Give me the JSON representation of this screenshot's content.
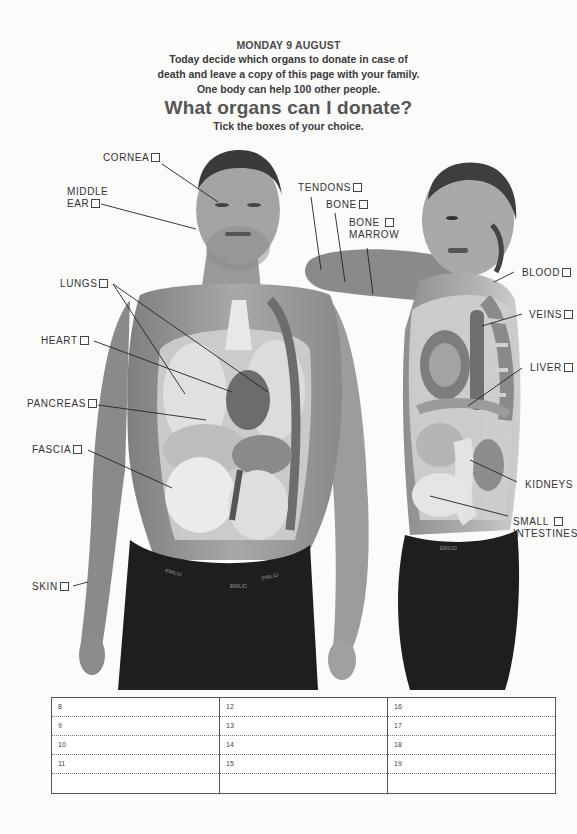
{
  "header": {
    "date": "MONDAY 9 AUGUST",
    "intro_line1": "Today decide which organs to donate in case of",
    "intro_line2": "death and leave a copy of this page with your family.",
    "intro_line3": "One body can help 100 other people.",
    "title": "What organs can I donate?",
    "subtitle": "Tick the boxes of your choice."
  },
  "labels": {
    "cornea": "CORNEA",
    "middle_ear_1": "MIDDLE",
    "middle_ear_2": "EAR",
    "lungs": "LUNGS",
    "heart": "HEART",
    "pancreas": "PANCREAS",
    "fascia": "FASCIA",
    "skin": "SKIN",
    "tendons": "TENDONS",
    "bone": "BONE",
    "bone_marrow_1": "BONE",
    "bone_marrow_2": "MARROW",
    "blood": "BLOOD",
    "veins": "VEINS",
    "liver": "LIVER",
    "kidneys": "KIDNEYS",
    "small_intestines_1": "SMALL",
    "small_intestines_2": "INTESTINES"
  },
  "photo": {
    "waistband_brand": "EMILIO"
  },
  "planner": {
    "columns": [
      [
        "8",
        "9",
        "10",
        "11",
        ""
      ],
      [
        "12",
        "13",
        "14",
        "15",
        ""
      ],
      [
        "16",
        "17",
        "18",
        "19",
        ""
      ]
    ]
  },
  "colors": {
    "skin": "#9a9a9a",
    "organ_light": "#d4d4d2",
    "organ_dark": "#7c7c7c",
    "shorts": "#1e1e1e",
    "page": "#fbfbfa"
  }
}
